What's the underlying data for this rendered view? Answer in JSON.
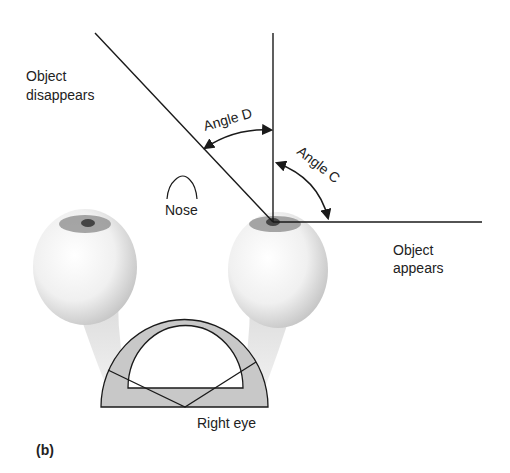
{
  "figure": {
    "panel_label": "(b)",
    "labels": {
      "object_disappears": [
        "Object",
        "disappears"
      ],
      "object_appears": [
        "Object",
        "appears"
      ],
      "angle_d": "Angle D",
      "angle_c": "Angle C",
      "nose": "Nose",
      "right_eye": "Right eye"
    },
    "colors": {
      "line": "#1a1a1a",
      "protractor_fill": "#c8c8c8",
      "eye_shade": "#d9d9d9",
      "pupil": "#6a6a6a"
    }
  }
}
